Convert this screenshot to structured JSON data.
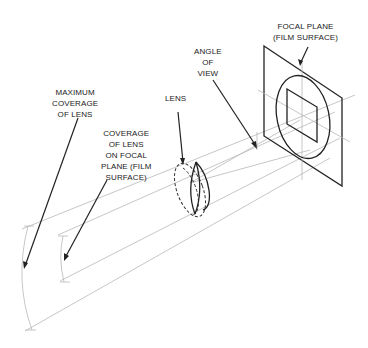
{
  "diagram": {
    "labels": {
      "focal_plane": [
        "FOCAL PLANE",
        "(FILM SURFACE)"
      ],
      "angle_of_view": [
        "ANGLE",
        "OF",
        "VIEW"
      ],
      "lens": [
        "LENS"
      ],
      "maximum_coverage": [
        "MAXIMUM",
        "COVERAGE",
        "OF LENS"
      ],
      "coverage_on_focal_plane": [
        "COVERAGE",
        "OF LENS",
        "ON FOCAL",
        "PLANE (FILM",
        "SURFACE)"
      ]
    },
    "components": [
      {
        "id": "focal-plane",
        "shape": "parallelogram",
        "contains": [
          "image-circle",
          "film-frame",
          "crosshair-axes"
        ]
      },
      {
        "id": "lens",
        "shape": "ellipse",
        "style": "partly dashed outline with inner lens element"
      },
      {
        "id": "light-rays",
        "shape": "lines",
        "from": "focal-plane",
        "through": "lens",
        "to": "coverage arcs"
      },
      {
        "id": "maximum-coverage-arc",
        "shape": "arc"
      },
      {
        "id": "focal-plane-coverage-arc",
        "shape": "arc"
      }
    ],
    "colors": {
      "line_dark": "#222222",
      "line_light": "#b8b8b8",
      "background": "#ffffff"
    }
  }
}
